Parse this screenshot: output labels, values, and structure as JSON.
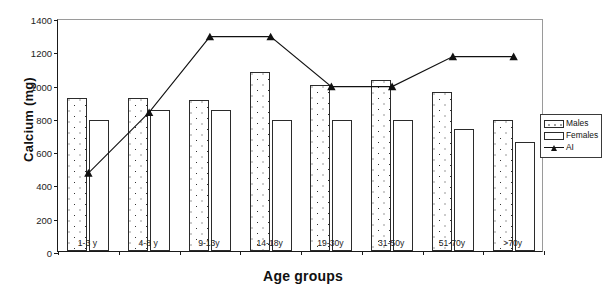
{
  "chart_data": {
    "type": "bar",
    "title": "",
    "xlabel": "Age groups",
    "ylabel": "Calcium (mg)",
    "categories": [
      "1-3 y",
      "4-8 y",
      "9-13y",
      "14-18y",
      "19-30y",
      "31-50y",
      "51-70y",
      ">70y"
    ],
    "ylim": [
      0,
      1400
    ],
    "yticks": [
      0,
      200,
      400,
      600,
      800,
      1000,
      1200,
      1400
    ],
    "grid": false,
    "legend_position": "right",
    "series": [
      {
        "name": "Males",
        "type": "bar",
        "values": [
          917,
          920,
          910,
          1075,
          1000,
          1025,
          955,
          790
        ]
      },
      {
        "name": "Females",
        "type": "bar",
        "values": [
          785,
          845,
          850,
          785,
          785,
          785,
          735,
          655
        ]
      },
      {
        "name": "AI",
        "type": "line",
        "values": [
          480,
          845,
          1300,
          1300,
          1000,
          1000,
          1180,
          1180
        ]
      }
    ]
  },
  "legend": {
    "items": [
      {
        "label": "Males",
        "marker": "dotted-bar-swatch"
      },
      {
        "label": "Females",
        "marker": "white-bar-swatch"
      },
      {
        "label": "AI",
        "marker": "line-triangle-marker"
      }
    ]
  },
  "colors": {
    "axis": "#1a1a1a",
    "bar_outline": "#2b2b2b",
    "line": "#111111",
    "background": "#ffffff"
  }
}
